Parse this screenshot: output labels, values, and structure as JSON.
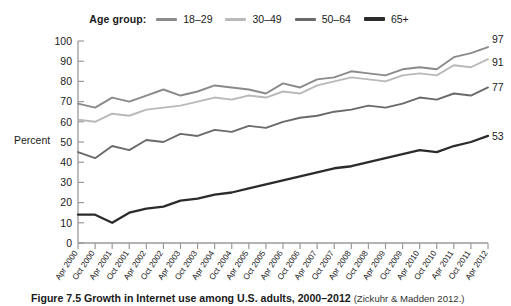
{
  "legend": {
    "title": "Age group:",
    "items": [
      {
        "label": "18–29",
        "color": "#8a8a8a"
      },
      {
        "label": "30–49",
        "color": "#b9b9b9"
      },
      {
        "label": "50–64",
        "color": "#6a6a6a"
      },
      {
        "label": "65+",
        "color": "#2b2b2b"
      }
    ]
  },
  "caption": {
    "figure_number": "Figure 7.5",
    "title": "Growth in Internet use among U.S. adults, 2000–2012",
    "source": "(Zickuhr & Madden 2012.)"
  },
  "chart_data": {
    "type": "line",
    "title": "Growth in Internet use among U.S. adults, 2000–2012",
    "xlabel": "",
    "ylabel": "Percent",
    "ylim": [
      0,
      100
    ],
    "yticks": [
      0,
      10,
      20,
      30,
      40,
      50,
      60,
      70,
      80,
      90,
      100
    ],
    "grid": false,
    "legend_position": "top-center",
    "categories": [
      "Apr 2000",
      "Oct 2000",
      "Apr 2001",
      "Oct 2001",
      "Apr 2002",
      "Oct 2002",
      "Apr 2003",
      "Oct 2003",
      "Apr 2004",
      "Oct 2004",
      "Apr 2005",
      "Oct 2005",
      "Apr 2006",
      "Oct 2006",
      "Apr 2007",
      "Oct 2007",
      "Apr 2008",
      "Oct 2008",
      "Apr 2009",
      "Oct 2009",
      "Apr 2010",
      "Oct 2010",
      "Apr 2011",
      "Oct 2011",
      "Apr 2012"
    ],
    "series": [
      {
        "name": "18–29",
        "color": "#8a8a8a",
        "end_label": "97",
        "values": [
          69,
          67,
          72,
          70,
          73,
          76,
          73,
          75,
          78,
          77,
          76,
          74,
          79,
          77,
          81,
          82,
          85,
          84,
          83,
          86,
          87,
          86,
          92,
          94,
          97
        ]
      },
      {
        "name": "30–49",
        "color": "#b9b9b9",
        "end_label": "91",
        "values": [
          61,
          60,
          64,
          63,
          66,
          67,
          68,
          70,
          72,
          71,
          73,
          72,
          75,
          74,
          78,
          80,
          82,
          81,
          80,
          83,
          84,
          83,
          88,
          87,
          91
        ]
      },
      {
        "name": "50–64",
        "color": "#6a6a6a",
        "end_label": "77",
        "values": [
          45,
          42,
          48,
          46,
          51,
          50,
          54,
          53,
          56,
          55,
          58,
          57,
          60,
          62,
          63,
          65,
          66,
          68,
          67,
          69,
          72,
          71,
          74,
          73,
          77
        ]
      },
      {
        "name": "65+",
        "color": "#2b2b2b",
        "end_label": "53",
        "values": [
          14,
          14,
          10,
          15,
          17,
          18,
          21,
          22,
          24,
          25,
          27,
          29,
          31,
          33,
          35,
          37,
          38,
          40,
          42,
          44,
          46,
          45,
          48,
          50,
          53
        ]
      }
    ]
  }
}
